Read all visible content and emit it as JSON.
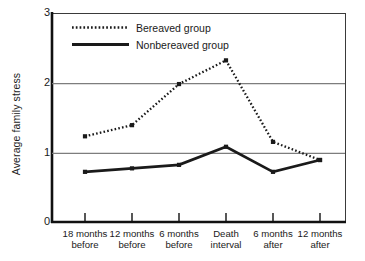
{
  "chart_data": {
    "type": "line",
    "title": "",
    "xlabel": "",
    "ylabel": "Average family stress",
    "ylim": [
      0,
      3
    ],
    "yticks": [
      0,
      1,
      2,
      3
    ],
    "grid": "horizontal",
    "legend_position": "top-left-inside",
    "categories": [
      "18 months before",
      "12 months before",
      "6 months before",
      "Death interval",
      "6 months after",
      "12 months after"
    ],
    "category_lines": [
      [
        "18 months",
        "before"
      ],
      [
        "12 months",
        "before"
      ],
      [
        "6 months",
        "before"
      ],
      [
        "Death",
        "interval"
      ],
      [
        "6 months",
        "after"
      ],
      [
        "12 months",
        "after"
      ]
    ],
    "series": [
      {
        "name": "Bereaved group",
        "style": "dotted",
        "color": "#1a1a1a",
        "marker": "square",
        "values": [
          1.23,
          1.39,
          1.98,
          2.32,
          1.15,
          0.89
        ]
      },
      {
        "name": "Nonbereaved group",
        "style": "solid",
        "color": "#1a1a1a",
        "marker": "square",
        "values": [
          0.72,
          0.77,
          0.82,
          1.08,
          0.72,
          0.89
        ]
      }
    ]
  },
  "axis": {
    "y_tick_labels": [
      "3",
      "2",
      "1",
      "0"
    ],
    "y_title": "Average family stress"
  },
  "legend": {
    "items": [
      {
        "label": "Bereaved group",
        "style": "dotted"
      },
      {
        "label": "Nonbereaved group",
        "style": "solid"
      }
    ]
  },
  "colors": {
    "ink": "#1a1a1a",
    "grid": "#808080",
    "background": "#ffffff"
  }
}
